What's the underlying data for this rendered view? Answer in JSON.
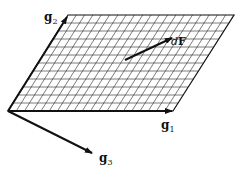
{
  "figure": {
    "colors": {
      "line": "#111111",
      "grid": "#222222",
      "background": "#ffffff"
    },
    "grid": {
      "columns": 20,
      "rows": 12
    },
    "corners": {
      "bottom_left": [
        8,
        111
      ],
      "bottom_right": [
        173,
        111
      ],
      "top_right": [
        234,
        15
      ],
      "top_left": [
        68,
        15
      ]
    },
    "vectors": {
      "g1": {
        "label": "g",
        "subscript": "1",
        "from": [
          8,
          111
        ],
        "to": [
          172,
          111
        ]
      },
      "g2": {
        "label": "g",
        "subscript": "2",
        "from": [
          8,
          111
        ],
        "to": [
          68,
          15
        ]
      },
      "g3": {
        "label": "g",
        "subscript": "3",
        "from": [
          8,
          111
        ],
        "to": [
          92,
          153
        ]
      },
      "dF": {
        "label_d": "d",
        "label_F": "F",
        "from": [
          125,
          60
        ],
        "to": [
          172,
          38
        ]
      }
    }
  }
}
